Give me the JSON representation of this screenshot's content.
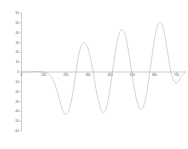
{
  "chart_data": {
    "type": "line",
    "title": "",
    "subtitle": "",
    "xlabel": "",
    "ylabel": "",
    "xlim": [
      0,
      740
    ],
    "ylim": [
      -60,
      60
    ],
    "grid": false,
    "legend": null,
    "legend_position": "none",
    "x_ticks": [
      0,
      100,
      200,
      300,
      400,
      500,
      600,
      700
    ],
    "x_tick_labels": [
      "0",
      "100",
      "200",
      "300",
      "400",
      "500",
      "600",
      "700"
    ],
    "y_ticks": [
      60,
      50,
      40,
      30,
      20,
      10,
      0,
      -10,
      -20,
      -30,
      -40,
      -50,
      -60
    ],
    "y_tick_labels": [
      "60",
      "50",
      "40",
      "30",
      "20",
      "10",
      "0",
      "-10",
      "-20",
      "-30",
      "-40",
      "-50",
      "-60"
    ],
    "series": [
      {
        "name": "signal",
        "color": "#b9b9b9",
        "x": [
          0,
          10,
          20,
          30,
          40,
          50,
          60,
          70,
          80,
          90,
          100,
          110,
          120,
          130,
          140,
          150,
          160,
          170,
          180,
          190,
          200,
          210,
          220,
          230,
          240,
          250,
          260,
          270,
          280,
          290,
          300,
          310,
          320,
          330,
          340,
          350,
          360,
          370,
          380,
          390,
          400,
          410,
          420,
          430,
          440,
          450,
          460,
          470,
          480,
          490,
          500,
          510,
          520,
          530,
          540,
          550,
          560,
          570,
          580,
          590,
          600,
          610,
          620,
          630,
          640,
          650,
          660,
          670,
          680,
          690,
          700,
          710,
          720,
          730,
          740
        ],
        "y": [
          0,
          0,
          0,
          0,
          0,
          0.2,
          0.4,
          0.5,
          0.4,
          0.2,
          0,
          -0.5,
          -1.5,
          -3.5,
          -7,
          -12,
          -19,
          -27,
          -35,
          -41,
          -43,
          -41,
          -34,
          -23,
          -9,
          7,
          19,
          27,
          30,
          29,
          24,
          15,
          4,
          -9,
          -22,
          -32,
          -39,
          -41,
          -38,
          -30,
          -17,
          -1,
          15,
          29,
          38,
          43,
          42,
          36,
          25,
          11,
          -4,
          -18,
          -29,
          -36,
          -38,
          -35,
          -27,
          -14,
          2,
          18,
          33,
          44,
          50,
          50,
          44,
          33,
          19,
          5,
          -5,
          -10,
          -11,
          -9,
          -5,
          -2,
          0
        ]
      }
    ]
  }
}
